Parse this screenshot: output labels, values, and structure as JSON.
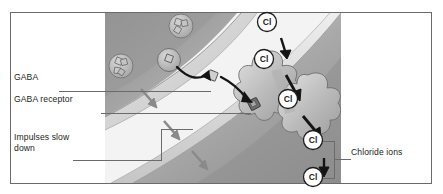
{
  "figure": {
    "panel_bg": "#d8d8d8",
    "border_color": "#6b6b6b",
    "ink": "#231f20"
  },
  "labels": {
    "gaba": "GABA",
    "gaba_receptor": "GABA receptor",
    "impulses": "Impulses slow\ndown",
    "chloride_ions": "Chloride ions"
  },
  "ions": {
    "symbol": "Cl",
    "items": [
      {
        "id": "cl-top",
        "symbol": "Cl",
        "x": 267,
        "y": 22
      },
      {
        "id": "cl-upper-mid",
        "symbol": "Cl",
        "x": 264,
        "y": 59
      },
      {
        "id": "cl-channel",
        "symbol": "Cl",
        "x": 288,
        "y": 99
      },
      {
        "id": "cl-lower",
        "symbol": "Cl",
        "x": 313,
        "y": 140
      },
      {
        "id": "cl-bottom",
        "symbol": "Cl",
        "x": 313,
        "y": 177
      }
    ]
  },
  "structures": {
    "presynaptic_cell": "presynaptic neuron terminal",
    "postsynaptic_cell": "postsynaptic neuron",
    "synaptic_cleft": "synaptic cleft",
    "vesicles": 3,
    "impulse_arrows": 3,
    "channel": "chloride channel protein"
  },
  "colors": {
    "cell_dark": "#9b9b9b",
    "cell_mid": "#b4b4b4",
    "cell_light": "#d0d0d0",
    "membrane": "#c9c9c9",
    "cleft": "#f2f2f2",
    "arrow_gray": "#8a8a8a",
    "arrow_black": "#1a1a1a"
  }
}
